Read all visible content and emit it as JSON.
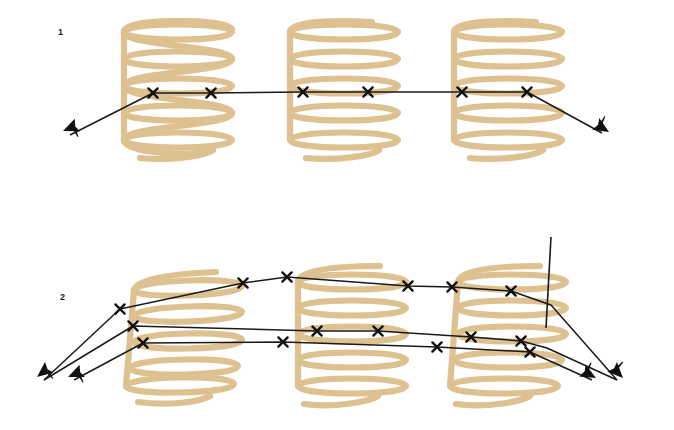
{
  "figure": {
    "background_color": "#ffffff",
    "width": 674,
    "height": 430,
    "coil_color": "#ddc08e",
    "coil_color_shadow": "#d4b683",
    "line_color": "#1a1a1a",
    "panels": [
      {
        "id": "panel-1",
        "label": "1",
        "label_position": {
          "x": 58,
          "y": 28
        },
        "description": "single horizontal ray traversing three helical coils"
      },
      {
        "id": "panel-2",
        "label": "2",
        "label_position": {
          "x": 60,
          "y": 293
        },
        "description": "two converging rays traversing three helical coils with a vertical tangent line"
      }
    ],
    "coils": [
      {
        "id": "coil-1-1",
        "panel": 1,
        "cx": 178,
        "top": 22,
        "bottom": 166,
        "rx": 54,
        "ry": 13,
        "turns": 5
      },
      {
        "id": "coil-1-2",
        "panel": 1,
        "cx": 344,
        "top": 22,
        "bottom": 166,
        "rx": 54,
        "ry": 13,
        "turns": 5
      },
      {
        "id": "coil-1-3",
        "panel": 1,
        "cx": 508,
        "top": 22,
        "bottom": 166,
        "rx": 54,
        "ry": 13,
        "turns": 5
      },
      {
        "id": "coil-2-1",
        "panel": 2,
        "cx": 188,
        "top": 268,
        "bottom": 400,
        "rx": 54,
        "ry": 13,
        "turns": 5
      },
      {
        "id": "coil-2-2",
        "panel": 2,
        "cx": 352,
        "top": 262,
        "bottom": 396,
        "rx": 54,
        "ry": 13,
        "turns": 5
      },
      {
        "id": "coil-2-3",
        "panel": 2,
        "cx": 512,
        "top": 262,
        "bottom": 396,
        "rx": 54,
        "ry": 13,
        "turns": 5
      }
    ],
    "rays": [
      {
        "id": "ray-1",
        "panel": 1,
        "points": [
          [
            64,
            138
          ],
          [
            153,
            93
          ],
          [
            211,
            93
          ],
          [
            303,
            92
          ],
          [
            368,
            92
          ],
          [
            462,
            92
          ],
          [
            527,
            92
          ],
          [
            608,
            136
          ]
        ],
        "arrow_ends": [
          "start",
          "end"
        ],
        "cross_marks": [
          [
            153,
            93
          ],
          [
            211,
            93
          ],
          [
            303,
            92
          ],
          [
            368,
            92
          ],
          [
            462,
            92
          ],
          [
            527,
            92
          ]
        ]
      },
      {
        "id": "ray-2-upper",
        "panel": 2,
        "points": [
          [
            38,
            382
          ],
          [
            120,
            309
          ],
          [
            243,
            283
          ],
          [
            287,
            277
          ],
          [
            408,
            286
          ],
          [
            452,
            287
          ],
          [
            511,
            291
          ],
          [
            551,
            305
          ],
          [
            622,
            382
          ]
        ],
        "arrow_ends": [
          "start",
          "end"
        ],
        "cross_marks": [
          [
            120,
            309
          ],
          [
            243,
            283
          ],
          [
            287,
            277
          ],
          [
            408,
            286
          ],
          [
            452,
            287
          ],
          [
            511,
            291
          ]
        ]
      },
      {
        "id": "ray-2-lower",
        "panel": 2,
        "points": [
          [
            38,
            382
          ],
          [
            133,
            326
          ],
          [
            317,
            331
          ],
          [
            378,
            331
          ],
          [
            471,
            337
          ],
          [
            521,
            341
          ],
          [
            547,
            348
          ],
          [
            622,
            382
          ]
        ],
        "arrow_ends": [
          "start",
          "end"
        ],
        "cross_marks": [
          [
            133,
            326
          ],
          [
            317,
            331
          ],
          [
            378,
            331
          ],
          [
            471,
            337
          ],
          [
            521,
            341
          ]
        ]
      },
      {
        "id": "ray-2-inner",
        "panel": 2,
        "points": [
          [
            68,
            382
          ],
          [
            143,
            343
          ],
          [
            240,
            342
          ],
          [
            283,
            342
          ],
          [
            437,
            347
          ],
          [
            530,
            352
          ],
          [
            597,
            382
          ]
        ],
        "arrow_ends": [
          "start",
          "end"
        ],
        "cross_marks": [
          [
            143,
            343
          ],
          [
            240,
            342
          ],
          [
            283,
            342
          ],
          [
            437,
            347
          ],
          [
            530,
            352
          ]
        ]
      }
    ],
    "tangent_line": {
      "id": "tangent-line",
      "panel": 2,
      "points": [
        [
          551,
          237
        ],
        [
          546,
          328
        ]
      ]
    }
  }
}
